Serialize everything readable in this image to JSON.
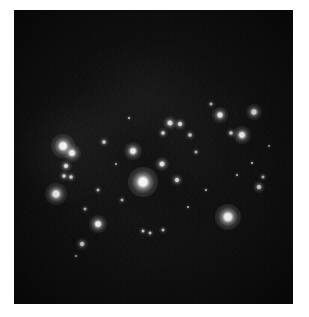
{
  "page": {
    "background_color": "#ffffff",
    "width": 309,
    "height": 317,
    "caption": ""
  },
  "plate": {
    "name": "star-field-photograph",
    "x": 14,
    "y": 10,
    "width": 279,
    "height": 294,
    "background_color": "#0b0b0b",
    "grain_opacity": 0.55,
    "description": "Astronomical photographic plate of a sparse open star cluster field"
  },
  "nebulosity": [
    {
      "x": 80,
      "y": 135,
      "w": 150,
      "h": 70,
      "color": "#2a2a2a",
      "opacity": 0.55,
      "rot": -12
    },
    {
      "x": 150,
      "y": 100,
      "w": 130,
      "h": 85,
      "color": "#272727",
      "opacity": 0.5,
      "rot": 8
    },
    {
      "x": 95,
      "y": 175,
      "w": 140,
      "h": 60,
      "color": "#242424",
      "opacity": 0.45,
      "rot": -6
    },
    {
      "x": 185,
      "y": 150,
      "w": 110,
      "h": 75,
      "color": "#222222",
      "opacity": 0.4,
      "rot": 18
    },
    {
      "x": 55,
      "y": 165,
      "w": 80,
      "h": 55,
      "color": "#202020",
      "opacity": 0.38,
      "rot": -20
    },
    {
      "x": 130,
      "y": 215,
      "w": 120,
      "h": 45,
      "color": "#1e1e1e",
      "opacity": 0.34,
      "rot": 5
    },
    {
      "x": 210,
      "y": 115,
      "w": 95,
      "h": 55,
      "color": "#1f1f1f",
      "opacity": 0.35,
      "rot": -14
    }
  ],
  "stars": [
    {
      "id": "star-01",
      "x": 143,
      "y": 182,
      "r": 4.6,
      "mag": 1.0,
      "color": "#ffffff"
    },
    {
      "id": "star-02",
      "x": 228,
      "y": 217,
      "r": 4.2,
      "mag": 0.96,
      "color": "#ffffff"
    },
    {
      "id": "star-03",
      "x": 63,
      "y": 146,
      "r": 3.8,
      "mag": 0.92,
      "color": "#ffffff"
    },
    {
      "id": "star-04",
      "x": 56,
      "y": 194,
      "r": 3.4,
      "mag": 0.86,
      "color": "#ffffff"
    },
    {
      "id": "star-05",
      "x": 72,
      "y": 153,
      "r": 2.9,
      "mag": 0.8,
      "color": "#f6f6f6"
    },
    {
      "id": "star-06",
      "x": 133,
      "y": 151,
      "r": 2.8,
      "mag": 0.78,
      "color": "#f4f4f4"
    },
    {
      "id": "star-07",
      "x": 98,
      "y": 224,
      "r": 2.8,
      "mag": 0.78,
      "color": "#f4f4f4"
    },
    {
      "id": "star-08",
      "x": 242,
      "y": 135,
      "r": 2.7,
      "mag": 0.76,
      "color": "#f2f2f2"
    },
    {
      "id": "star-09",
      "x": 254,
      "y": 112,
      "r": 2.5,
      "mag": 0.72,
      "color": "#efefef"
    },
    {
      "id": "star-10",
      "x": 220,
      "y": 115,
      "r": 2.4,
      "mag": 0.7,
      "color": "#ededed"
    },
    {
      "id": "star-11",
      "x": 162,
      "y": 164,
      "r": 2.3,
      "mag": 0.68,
      "color": "#ebebeb"
    },
    {
      "id": "star-12",
      "x": 170,
      "y": 123,
      "r": 2.2,
      "mag": 0.66,
      "color": "#e9e9e9"
    },
    {
      "id": "star-13",
      "x": 180,
      "y": 124,
      "r": 2.0,
      "mag": 0.6,
      "color": "#e4e4e4"
    },
    {
      "id": "star-14",
      "x": 66,
      "y": 166,
      "r": 2.0,
      "mag": 0.6,
      "color": "#e4e4e4"
    },
    {
      "id": "star-15",
      "x": 259,
      "y": 187,
      "r": 2.0,
      "mag": 0.6,
      "color": "#e2e2e2"
    },
    {
      "id": "star-16",
      "x": 177,
      "y": 180,
      "r": 1.9,
      "mag": 0.56,
      "color": "#dedede"
    },
    {
      "id": "star-17",
      "x": 82,
      "y": 244,
      "r": 1.9,
      "mag": 0.56,
      "color": "#dedede"
    },
    {
      "id": "star-18",
      "x": 163,
      "y": 133,
      "r": 1.7,
      "mag": 0.5,
      "color": "#d6d6d6"
    },
    {
      "id": "star-19",
      "x": 64,
      "y": 176,
      "r": 1.7,
      "mag": 0.5,
      "color": "#d6d6d6"
    },
    {
      "id": "star-20",
      "x": 71,
      "y": 177,
      "r": 1.6,
      "mag": 0.47,
      "color": "#d2d2d2"
    },
    {
      "id": "star-21",
      "x": 104,
      "y": 142,
      "r": 1.6,
      "mag": 0.46,
      "color": "#d0d0d0"
    },
    {
      "id": "star-22",
      "x": 231,
      "y": 133,
      "r": 1.5,
      "mag": 0.44,
      "color": "#cccccc"
    },
    {
      "id": "star-23",
      "x": 190,
      "y": 135,
      "r": 1.5,
      "mag": 0.43,
      "color": "#cacaca"
    },
    {
      "id": "star-24",
      "x": 263,
      "y": 177,
      "r": 1.4,
      "mag": 0.4,
      "color": "#c4c4c4"
    },
    {
      "id": "star-25",
      "x": 143,
      "y": 231,
      "r": 1.4,
      "mag": 0.4,
      "color": "#c4c4c4"
    },
    {
      "id": "star-26",
      "x": 150,
      "y": 233,
      "r": 1.3,
      "mag": 0.37,
      "color": "#bebebe"
    },
    {
      "id": "star-27",
      "x": 163,
      "y": 230,
      "r": 1.3,
      "mag": 0.36,
      "color": "#bcbcbc"
    },
    {
      "id": "star-28",
      "x": 98,
      "y": 190,
      "r": 1.3,
      "mag": 0.36,
      "color": "#bcbcbc"
    },
    {
      "id": "star-29",
      "x": 211,
      "y": 104,
      "r": 1.2,
      "mag": 0.33,
      "color": "#b6b6b6"
    },
    {
      "id": "star-30",
      "x": 196,
      "y": 152,
      "r": 1.2,
      "mag": 0.32,
      "color": "#b4b4b4"
    },
    {
      "id": "star-31",
      "x": 122,
      "y": 200,
      "r": 1.1,
      "mag": 0.3,
      "color": "#aeaeae"
    },
    {
      "id": "star-32",
      "x": 85,
      "y": 209,
      "r": 1.1,
      "mag": 0.29,
      "color": "#acacac"
    },
    {
      "id": "star-33",
      "x": 252,
      "y": 163,
      "r": 1.0,
      "mag": 0.27,
      "color": "#a6a6a6"
    },
    {
      "id": "star-34",
      "x": 129,
      "y": 118,
      "r": 1.0,
      "mag": 0.26,
      "color": "#a4a4a4"
    },
    {
      "id": "star-35",
      "x": 206,
      "y": 190,
      "r": 1.0,
      "mag": 0.25,
      "color": "#a0a0a0"
    },
    {
      "id": "star-36",
      "x": 76,
      "y": 256,
      "r": 0.9,
      "mag": 0.23,
      "color": "#9a9a9a"
    },
    {
      "id": "star-37",
      "x": 188,
      "y": 207,
      "r": 0.9,
      "mag": 0.22,
      "color": "#989898"
    },
    {
      "id": "star-38",
      "x": 237,
      "y": 175,
      "r": 0.9,
      "mag": 0.22,
      "color": "#989898"
    },
    {
      "id": "star-39",
      "x": 116,
      "y": 164,
      "r": 0.8,
      "mag": 0.2,
      "color": "#929292"
    },
    {
      "id": "star-40",
      "x": 269,
      "y": 146,
      "r": 0.8,
      "mag": 0.19,
      "color": "#8e8e8e"
    }
  ]
}
